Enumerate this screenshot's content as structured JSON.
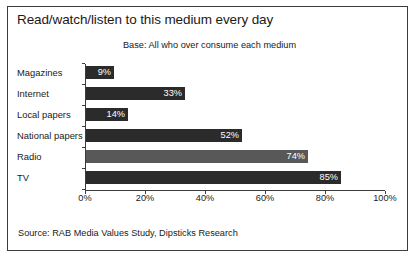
{
  "title": "Read/watch/listen to this medium every day",
  "subtitle": "Base: All who over consume each medium",
  "source": "Source: RAB Media Values Study, Dipsticks Research",
  "colors": {
    "bar_dark": "#2b2b2b",
    "bar_gray": "#585858",
    "label_text": "#ffffff",
    "axis": "#3c3c3c",
    "frame": "#3c3c3c",
    "text": "#1a1a1a",
    "background": "#ffffff"
  },
  "chart_data": {
    "type": "bar",
    "orientation": "horizontal",
    "title": "Read/watch/listen to this medium every day",
    "subtitle": "Base: All who over consume each medium",
    "xlabel": "",
    "ylabel": "",
    "xlim": [
      0,
      100
    ],
    "xticks": [
      0,
      20,
      40,
      60,
      80,
      100
    ],
    "xtick_labels": [
      "0%",
      "20%",
      "40%",
      "60%",
      "80%",
      "100%"
    ],
    "grid": false,
    "legend": false,
    "categories": [
      "Magazines",
      "Internet",
      "Local papers",
      "National papers",
      "Radio",
      "TV"
    ],
    "values": [
      9,
      33,
      14,
      52,
      74,
      85
    ],
    "value_labels": [
      "9%",
      "33%",
      "14%",
      "52%",
      "74%",
      "85%"
    ],
    "bar_colors": [
      "#2b2b2b",
      "#2b2b2b",
      "#2b2b2b",
      "#2b2b2b",
      "#585858",
      "#2b2b2b"
    ]
  }
}
